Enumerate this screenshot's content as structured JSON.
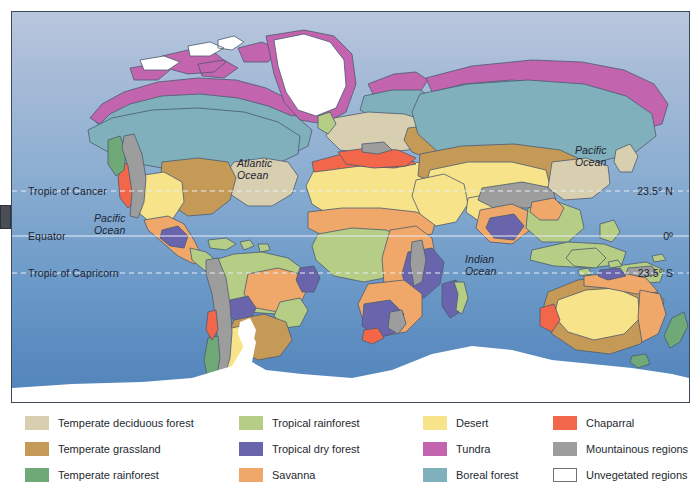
{
  "map": {
    "title": "World Biomes Map",
    "ocean_labels": [
      {
        "id": "atlantic",
        "text": "Atlantic\nOcean",
        "x": 236,
        "y": 153
      },
      {
        "id": "pacific-east",
        "text": "Pacific\nOcean",
        "x": 92,
        "y": 209
      },
      {
        "id": "pacific-west",
        "text": "Pacific\nOcean",
        "x": 573,
        "y": 141
      },
      {
        "id": "indian",
        "text": "Indian\nOcean",
        "x": 463,
        "y": 250
      }
    ],
    "latitude_lines": [
      {
        "id": "tropic-of-cancer",
        "left_label": "Tropic of Cancer",
        "right_label": "23.5° N",
        "y": 190
      },
      {
        "id": "equator",
        "left_label": "Equator",
        "right_label": "0º",
        "y": 235
      },
      {
        "id": "tropic-of-capricorn",
        "left_label": "Tropic of Capricorn",
        "right_label": "23.5° S",
        "y": 272
      }
    ],
    "colors": {
      "ocean_top": "#b9c7dd",
      "ocean_bottom": "#5084bb",
      "coastline": "#4a5a6e",
      "temperate_deciduous_forest": "#d8cfb0",
      "temperate_grassland": "#c59a57",
      "temperate_rainforest": "#6fa977",
      "tropical_rainforest": "#b6cd86",
      "tropical_dry_forest": "#6a64ad",
      "savanna": "#f0a86a",
      "desert": "#f7e389",
      "tundra": "#c264ae",
      "boreal_forest": "#7fb0bb",
      "chaparral": "#f2674a",
      "mountainous_regions": "#9d9d9d",
      "unvegetated_regions": "#ffffff"
    }
  },
  "legend": {
    "columns": [
      {
        "items": [
          {
            "label": "Temperate deciduous forest",
            "color": "#d8cfb0",
            "outlined": false
          },
          {
            "label": "Temperate grassland",
            "color": "#c59a57",
            "outlined": false
          },
          {
            "label": "Temperate rainforest",
            "color": "#6fa977",
            "outlined": false
          }
        ]
      },
      {
        "items": [
          {
            "label": "Tropical rainforest",
            "color": "#b6cd86",
            "outlined": false
          },
          {
            "label": "Tropical dry forest",
            "color": "#6a64ad",
            "outlined": false
          },
          {
            "label": "Savanna",
            "color": "#f0a86a",
            "outlined": false
          }
        ]
      },
      {
        "items": [
          {
            "label": "Desert",
            "color": "#f7e389",
            "outlined": false
          },
          {
            "label": "Tundra",
            "color": "#c264ae",
            "outlined": false
          },
          {
            "label": "Boreal forest",
            "color": "#7fb0bb",
            "outlined": false
          }
        ]
      },
      {
        "items": [
          {
            "label": "Chaparral",
            "color": "#f2674a",
            "outlined": false
          },
          {
            "label": "Mountainous regions",
            "color": "#9d9d9d",
            "outlined": false
          },
          {
            "label": "Unvegetated regions",
            "color": "#ffffff",
            "outlined": true
          }
        ]
      }
    ],
    "column_x": [
      14,
      228,
      412,
      542
    ],
    "row_y": [
      8,
      34,
      60
    ]
  }
}
